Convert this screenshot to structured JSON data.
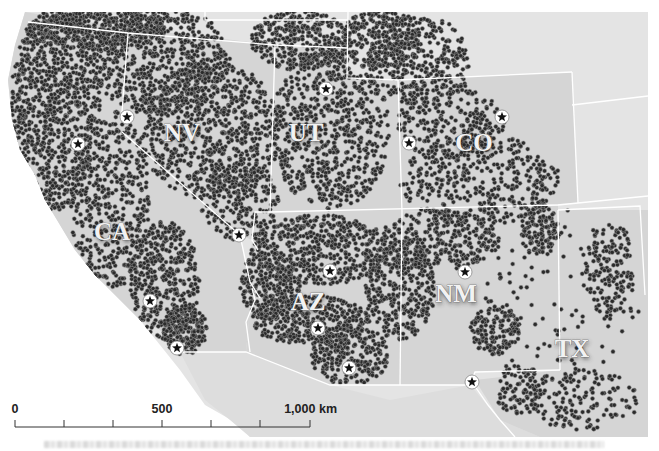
{
  "map": {
    "title": "Dot-density map of the southwestern United States",
    "colors": {
      "background": "#ffffff",
      "land_states": "#d7d7d7",
      "land_other": "#e4e4e4",
      "border": "#ffffff",
      "dot_fill": "#2b2b2b",
      "dot_stroke": "#9a9a9a",
      "star_circle": "#ffffff",
      "star": "#111111"
    },
    "state_labels": [
      {
        "id": "NV",
        "text": "NV",
        "x": 182,
        "y": 141
      },
      {
        "id": "UT",
        "text": "UT",
        "x": 306,
        "y": 141
      },
      {
        "id": "CO",
        "text": "CO",
        "x": 474,
        "y": 151
      },
      {
        "id": "CA",
        "text": "CA",
        "x": 112,
        "y": 240
      },
      {
        "id": "AZ",
        "text": "AZ",
        "x": 308,
        "y": 310
      },
      {
        "id": "NM",
        "text": "NM",
        "x": 456,
        "y": 302
      },
      {
        "id": "TX",
        "text": "TX",
        "x": 572,
        "y": 357
      }
    ],
    "city_markers": [
      {
        "name": "star-ca-north",
        "x": 78,
        "y": 144
      },
      {
        "name": "star-nv-reno",
        "x": 127,
        "y": 117
      },
      {
        "name": "star-ut-slc",
        "x": 326,
        "y": 89
      },
      {
        "name": "star-co-gj",
        "x": 409,
        "y": 143
      },
      {
        "name": "star-co-denver",
        "x": 502,
        "y": 117
      },
      {
        "name": "star-nv-lasvegas",
        "x": 239,
        "y": 235
      },
      {
        "name": "star-az-flagstaff",
        "x": 330,
        "y": 271
      },
      {
        "name": "star-nm-abq",
        "x": 465,
        "y": 272
      },
      {
        "name": "star-ca-la",
        "x": 150,
        "y": 301
      },
      {
        "name": "star-az-phoenix",
        "x": 318,
        "y": 328
      },
      {
        "name": "star-ca-sd",
        "x": 177,
        "y": 348
      },
      {
        "name": "star-az-tucson",
        "x": 349,
        "y": 368
      },
      {
        "name": "star-tx-elpaso",
        "x": 472,
        "y": 382
      }
    ],
    "scale_bar": {
      "labels": [
        {
          "text": "0",
          "x": 15
        },
        {
          "text": "500",
          "x": 162
        },
        {
          "text": "1,000 km",
          "x": 337
        }
      ],
      "x_start": 15,
      "x_end": 310,
      "y": 427,
      "ticks_x": [
        15,
        64,
        113,
        162,
        211,
        260,
        310
      ]
    },
    "dot_density_regions": [
      {
        "cx": 55,
        "cy": 110,
        "rx": 45,
        "ry": 100,
        "n": 900
      },
      {
        "cx": 110,
        "cy": 200,
        "rx": 40,
        "ry": 90,
        "n": 500
      },
      {
        "cx": 165,
        "cy": 280,
        "rx": 35,
        "ry": 60,
        "n": 420
      },
      {
        "cx": 185,
        "cy": 330,
        "rx": 22,
        "ry": 25,
        "n": 200
      },
      {
        "cx": 160,
        "cy": 60,
        "rx": 70,
        "ry": 55,
        "n": 700
      },
      {
        "cx": 210,
        "cy": 130,
        "rx": 70,
        "ry": 70,
        "n": 750
      },
      {
        "cx": 240,
        "cy": 200,
        "rx": 40,
        "ry": 40,
        "n": 220
      },
      {
        "cx": 95,
        "cy": 30,
        "rx": 70,
        "ry": 20,
        "n": 450
      },
      {
        "cx": 300,
        "cy": 40,
        "rx": 50,
        "ry": 30,
        "n": 380
      },
      {
        "cx": 330,
        "cy": 130,
        "rx": 60,
        "ry": 80,
        "n": 720
      },
      {
        "cx": 380,
        "cy": 40,
        "rx": 40,
        "ry": 30,
        "n": 280
      },
      {
        "cx": 420,
        "cy": 60,
        "rx": 50,
        "ry": 45,
        "n": 320
      },
      {
        "cx": 480,
        "cy": 180,
        "rx": 80,
        "ry": 45,
        "n": 420
      },
      {
        "cx": 450,
        "cy": 120,
        "rx": 55,
        "ry": 40,
        "n": 260
      },
      {
        "cx": 320,
        "cy": 250,
        "rx": 70,
        "ry": 35,
        "n": 520
      },
      {
        "cx": 310,
        "cy": 320,
        "rx": 60,
        "ry": 25,
        "n": 380
      },
      {
        "cx": 350,
        "cy": 355,
        "rx": 40,
        "ry": 30,
        "n": 240
      },
      {
        "cx": 270,
        "cy": 285,
        "rx": 30,
        "ry": 35,
        "n": 260
      },
      {
        "cx": 400,
        "cy": 290,
        "rx": 35,
        "ry": 50,
        "n": 340
      },
      {
        "cx": 440,
        "cy": 240,
        "rx": 60,
        "ry": 30,
        "n": 340
      },
      {
        "cx": 495,
        "cy": 330,
        "rx": 25,
        "ry": 25,
        "n": 150
      },
      {
        "cx": 540,
        "cy": 230,
        "rx": 20,
        "ry": 25,
        "n": 120
      },
      {
        "cx": 610,
        "cy": 270,
        "rx": 25,
        "ry": 50,
        "n": 160
      },
      {
        "cx": 580,
        "cy": 400,
        "rx": 60,
        "ry": 30,
        "n": 160
      },
      {
        "cx": 520,
        "cy": 390,
        "rx": 25,
        "ry": 25,
        "n": 90
      },
      {
        "cx": 560,
        "cy": 300,
        "rx": 80,
        "ry": 90,
        "n": 110
      }
    ]
  }
}
